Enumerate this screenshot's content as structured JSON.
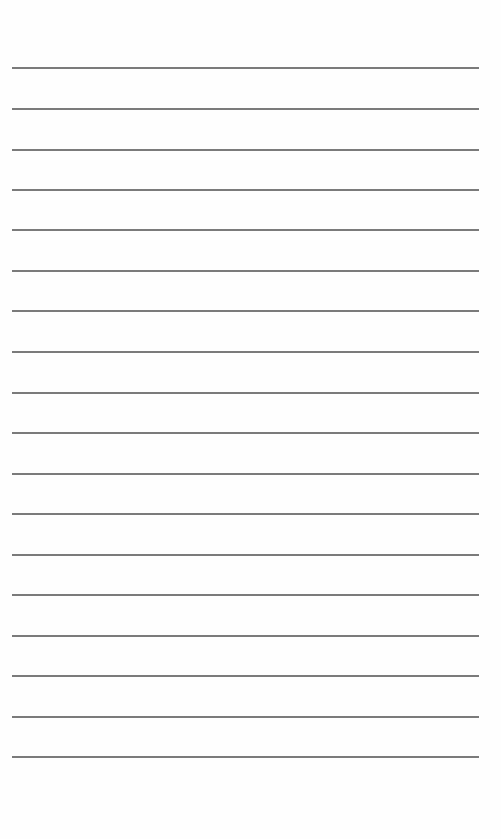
{
  "document": {
    "type": "ruled-writing-page",
    "background_color": "#fefefe",
    "line_color": "#555555",
    "line_count": 18,
    "line_left_px": 12,
    "line_right_px": 479,
    "line_thickness_px": 2,
    "lines": [
      {
        "y": 67,
        "text": ""
      },
      {
        "y": 108,
        "text": ""
      },
      {
        "y": 149,
        "text": ""
      },
      {
        "y": 189,
        "text": ""
      },
      {
        "y": 229,
        "text": ""
      },
      {
        "y": 270,
        "text": ""
      },
      {
        "y": 310,
        "text": ""
      },
      {
        "y": 351,
        "text": ""
      },
      {
        "y": 392,
        "text": ""
      },
      {
        "y": 432,
        "text": ""
      },
      {
        "y": 473,
        "text": ""
      },
      {
        "y": 513,
        "text": ""
      },
      {
        "y": 554,
        "text": ""
      },
      {
        "y": 594,
        "text": ""
      },
      {
        "y": 635,
        "text": ""
      },
      {
        "y": 675,
        "text": ""
      },
      {
        "y": 716,
        "text": ""
      },
      {
        "y": 756,
        "text": ""
      }
    ]
  }
}
